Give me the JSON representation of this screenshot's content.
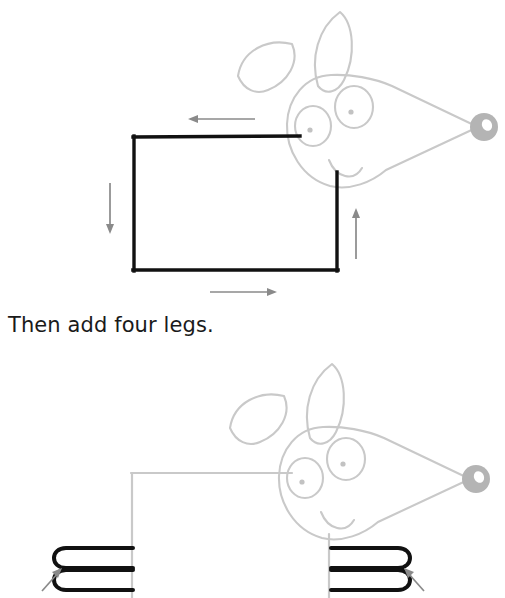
{
  "page": {
    "background_color": "#ffffff",
    "kind": "step-by-step drawing tutorial"
  },
  "instruction": {
    "text": "Then add four legs."
  },
  "colors": {
    "ink_black": "#111111",
    "guide_gray": "#c9c9c9",
    "arrow_gray": "#8a8a8a",
    "nose_gray": "#b4b4b4",
    "text_color": "#1a1a1a"
  },
  "panels": [
    {
      "id": "panel-step-body",
      "name": "draw-body-rectangle-step",
      "caption": "",
      "new_strokes_color": "#111111",
      "existing_strokes_color": "#c9c9c9",
      "shapes": {
        "body_rectangle": {
          "x": 133,
          "y": 136,
          "width": 205,
          "height": 135,
          "stroke": "#111111"
        },
        "head": {
          "nose_highlight": true,
          "ear_count": 2,
          "eye_count": 2
        }
      },
      "arrows": [
        {
          "name": "arrow-top-left",
          "direction": "left",
          "x1": 255,
          "y1": 119,
          "x2": 190,
          "y2": 119
        },
        {
          "name": "arrow-left-down",
          "direction": "down",
          "x1": 110,
          "y1": 183,
          "x2": 110,
          "y2": 232
        },
        {
          "name": "arrow-bottom-right",
          "direction": "right",
          "x1": 210,
          "y1": 292,
          "x2": 276,
          "y2": 292
        },
        {
          "name": "arrow-right-up",
          "direction": "up",
          "x1": 356,
          "y1": 258,
          "x2": 356,
          "y2": 210
        }
      ]
    },
    {
      "id": "panel-step-legs",
      "name": "draw-four-legs-step",
      "caption": "Then add four legs.",
      "new_strokes_color": "#111111",
      "existing_strokes_color": "#c9c9c9",
      "shapes": {
        "body_rectangle": {
          "x": 131,
          "y": 473,
          "width": 205,
          "height": 135,
          "stroke": "#c9c9c9"
        },
        "legs": [
          {
            "name": "leg-front-upper",
            "side": "left",
            "shape": "rounded-u-open-right"
          },
          {
            "name": "leg-front-lower",
            "side": "left",
            "shape": "rounded-u-open-right"
          },
          {
            "name": "leg-back-upper",
            "side": "right",
            "shape": "rounded-u-open-left"
          },
          {
            "name": "leg-back-lower",
            "side": "right",
            "shape": "rounded-u-open-left"
          }
        ]
      },
      "arrows": [
        {
          "name": "arrow-left-leg-pointer",
          "direction": "up-right",
          "x1": 44,
          "y1": 583,
          "x2": 62,
          "y2": 563
        },
        {
          "name": "arrow-right-leg-pointer",
          "direction": "up-left",
          "x1": 424,
          "y1": 583,
          "x2": 406,
          "y2": 563
        }
      ]
    }
  ]
}
